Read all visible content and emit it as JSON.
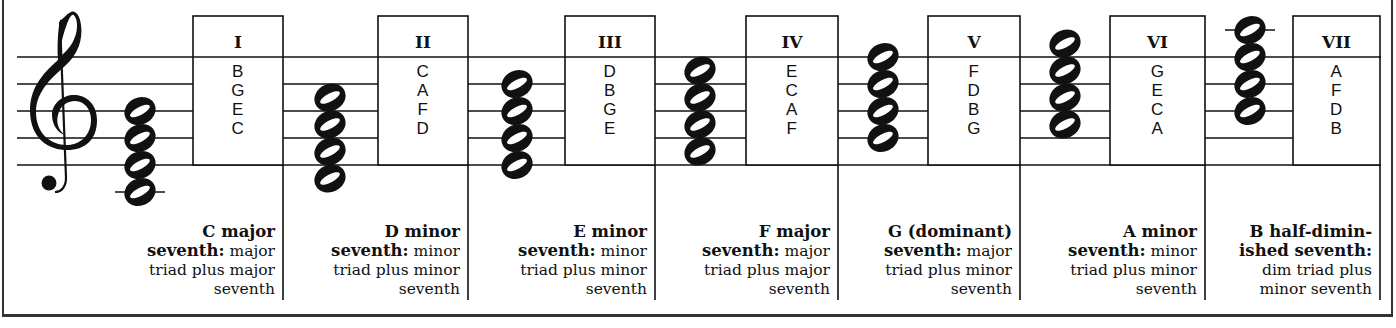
{
  "diagram": {
    "type": "seventh-chords-on-scale-degrees",
    "key": "C major",
    "clef": "treble",
    "staff": {
      "line_positions_y": [
        57,
        84,
        111,
        138,
        165
      ],
      "x_start": 17,
      "x_end": 1380
    },
    "chords": [
      {
        "numeral": "I",
        "notes_top_down": [
          "B",
          "G",
          "E",
          "C"
        ],
        "caption": {
          "name": "C major",
          "bold_second": "seventh:",
          "rest_second": " major",
          "line3": "triad plus major",
          "line4": "seventh"
        }
      },
      {
        "numeral": "II",
        "notes_top_down": [
          "C",
          "A",
          "F",
          "D"
        ],
        "caption": {
          "name": "D minor",
          "bold_second": "seventh:",
          "rest_second": " minor",
          "line3": "triad plus minor",
          "line4": "seventh"
        }
      },
      {
        "numeral": "III",
        "notes_top_down": [
          "D",
          "B",
          "G",
          "E"
        ],
        "caption": {
          "name": "E minor",
          "bold_second": "seventh:",
          "rest_second": " minor",
          "line3": "triad plus minor",
          "line4": "seventh"
        }
      },
      {
        "numeral": "IV",
        "notes_top_down": [
          "E",
          "C",
          "A",
          "F"
        ],
        "caption": {
          "name": "F major",
          "bold_second": "seventh:",
          "rest_second": " major",
          "line3": "triad plus major",
          "line4": "seventh"
        }
      },
      {
        "numeral": "V",
        "notes_top_down": [
          "F",
          "D",
          "B",
          "G"
        ],
        "caption": {
          "name": "G (dominant)",
          "bold_second": "seventh:",
          "rest_second": " major",
          "line3": "triad plus minor",
          "line4": "seventh"
        }
      },
      {
        "numeral": "VI",
        "notes_top_down": [
          "G",
          "E",
          "C",
          "A"
        ],
        "caption": {
          "name": "A minor",
          "bold_second": "seventh:",
          "rest_second": " minor",
          "line3": "triad plus minor",
          "line4": "seventh"
        }
      },
      {
        "numeral": "VII",
        "notes_top_down": [
          "A",
          "F",
          "D",
          "B"
        ],
        "caption": {
          "name": "B half-dimin-",
          "bold_second": "ished seventh:",
          "rest_second": "",
          "line3": "dim triad plus",
          "line4": "minor seventh"
        }
      }
    ]
  },
  "icons": {
    "clef": "treble-clef-icon",
    "note": "whole-note-icon"
  },
  "colors": {
    "ink": "#111111",
    "background": "#ffffff",
    "frame": "#333333"
  }
}
